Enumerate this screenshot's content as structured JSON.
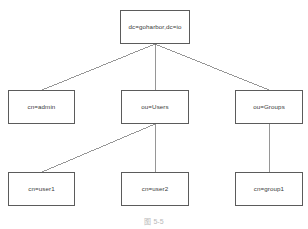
{
  "diagram": {
    "type": "ldap-directory-tree",
    "title": "",
    "nodes": [
      {
        "id": "root",
        "label": "dc=goharbor,dc=io",
        "x": 120,
        "y": 10,
        "w": 70,
        "h": 34,
        "level": 0
      },
      {
        "id": "admin",
        "label": "cn=admin",
        "x": 8,
        "y": 90,
        "w": 67,
        "h": 34,
        "level": 1
      },
      {
        "id": "users",
        "label": "ou=Users",
        "x": 121,
        "y": 90,
        "w": 68,
        "h": 34,
        "level": 1
      },
      {
        "id": "groups",
        "label": "ou=Groups",
        "x": 235,
        "y": 90,
        "w": 68,
        "h": 34,
        "level": 1
      },
      {
        "id": "user1",
        "label": "cn=user1",
        "x": 8,
        "y": 172,
        "w": 67,
        "h": 34,
        "level": 2
      },
      {
        "id": "user2",
        "label": "cn=user2",
        "x": 121,
        "y": 172,
        "w": 68,
        "h": 34,
        "level": 2
      },
      {
        "id": "group1",
        "label": "cn=group1",
        "x": 235,
        "y": 172,
        "w": 68,
        "h": 34,
        "level": 2
      }
    ],
    "edges": [
      {
        "id": "root-admin",
        "from": "root",
        "to": "admin",
        "x1": 155,
        "y1": 44,
        "x2": 42,
        "y2": 90
      },
      {
        "id": "root-users",
        "from": "root",
        "to": "users",
        "x1": 155,
        "y1": 44,
        "x2": 155,
        "y2": 90
      },
      {
        "id": "root-groups",
        "from": "root",
        "to": "groups",
        "x1": 155,
        "y1": 44,
        "x2": 269,
        "y2": 90
      },
      {
        "id": "users-user1",
        "from": "users",
        "to": "user1",
        "x1": 155,
        "y1": 124,
        "x2": 42,
        "y2": 172
      },
      {
        "id": "users-user2",
        "from": "users",
        "to": "user2",
        "x1": 155,
        "y1": 124,
        "x2": 155,
        "y2": 172
      },
      {
        "id": "groups-group1",
        "from": "groups",
        "to": "group1",
        "x1": 269,
        "y1": 124,
        "x2": 269,
        "y2": 172
      }
    ],
    "colors": {
      "node_border": "#5b5b5b",
      "node_fill": "#ffffff",
      "edge": "#6a6a6a",
      "label_text": "#3a3a3a",
      "caption_text": "#b9b9b9",
      "background": "#ffffff"
    },
    "caption": {
      "text": "图 5-5",
      "x": 0,
      "y": 216
    }
  }
}
